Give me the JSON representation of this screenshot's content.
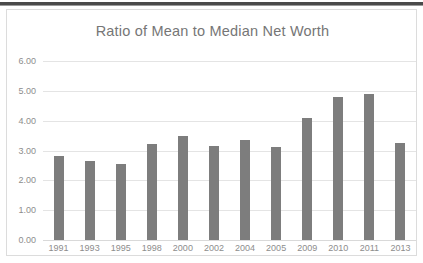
{
  "chart_data": {
    "type": "bar",
    "title": "Ratio of Mean to Median Net Worth",
    "xlabel": "",
    "ylabel": "",
    "categories": [
      "1991",
      "1993",
      "1995",
      "1998",
      "2000",
      "2002",
      "2004",
      "2005",
      "2009",
      "2010",
      "2011",
      "2013"
    ],
    "values": [
      2.8,
      2.65,
      2.55,
      3.23,
      3.5,
      3.14,
      3.34,
      3.12,
      4.08,
      4.78,
      4.88,
      3.24
    ],
    "ylim": [
      0.0,
      6.0
    ],
    "ytick_labels": [
      "6.00",
      "5.00",
      "4.00",
      "3.00",
      "2.00",
      "1.00",
      "0.00"
    ],
    "ytick_values": [
      6,
      5,
      4,
      3,
      2,
      1,
      0
    ],
    "grid": true,
    "legend": "none",
    "series_color": "#7d7d7d",
    "grid_color": "#e4e4e4",
    "text_color": "#8d8d8d",
    "title_color": "#767676"
  }
}
